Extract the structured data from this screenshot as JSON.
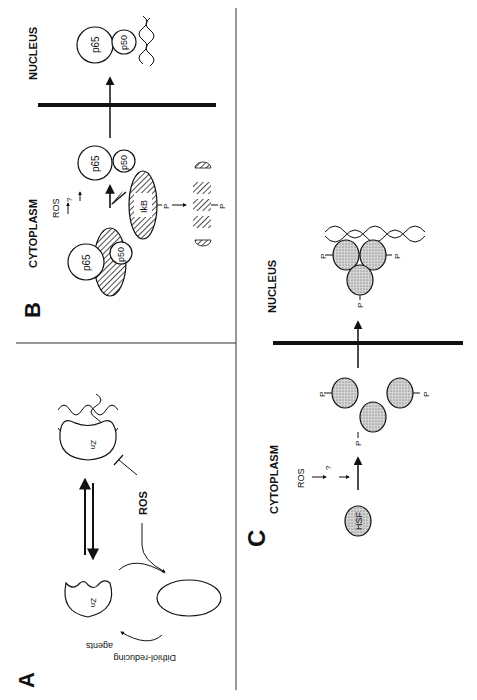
{
  "figure": {
    "orientation": "rotated 90° counter-clockwise",
    "colors": {
      "ink": "#111111",
      "background": "#ffffff",
      "stipple": "#bdbdbd"
    }
  },
  "panelA": {
    "label": "A",
    "zn_label_top": "Zn",
    "zn_label_bottom": "Zn",
    "ros_label": "ROS",
    "reducing_agents_line1": "Dithiol-reducing",
    "reducing_agents_line2": "agents"
  },
  "panelB": {
    "label": "B",
    "cytoplasm_label": "CYTOPLASM",
    "nucleus_label": "NUCLEUS",
    "ros_label": "ROS",
    "question_mark": "?",
    "complex_p65": "p65",
    "complex_p50": "p50",
    "released_p65": "p65",
    "released_p50": "p50",
    "nuclear_p65": "p65",
    "nuclear_p50": "p50",
    "ikb_label": "IkB",
    "phospho_1": "P",
    "phospho_2": "P"
  },
  "panelC": {
    "label": "C",
    "cytoplasm_label": "CYTOPLASM",
    "nucleus_label": "NUCLEUS",
    "ros_label": "ROS",
    "question_mark": "?",
    "hsf_label": "HSF",
    "phospho_labels": [
      "P",
      "P",
      "P"
    ],
    "nuclear_phospho_labels": [
      "P",
      "P",
      "P"
    ]
  }
}
